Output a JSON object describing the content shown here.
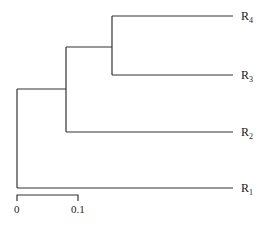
{
  "diagram": {
    "type": "phylogenetic-tree",
    "leaves": [
      {
        "id": "R4",
        "base": "R",
        "sub": "4"
      },
      {
        "id": "R3",
        "base": "R",
        "sub": "3"
      },
      {
        "id": "R2",
        "base": "R",
        "sub": "2"
      },
      {
        "id": "R1",
        "base": "R",
        "sub": "1"
      }
    ],
    "topology": "((R1,(R2,(R3,R4))))",
    "scale_bar": {
      "start_label": "0",
      "end_label": "0.1"
    },
    "colors": {
      "line": "#333333",
      "text": "#222222",
      "background": "#ffffff"
    }
  }
}
